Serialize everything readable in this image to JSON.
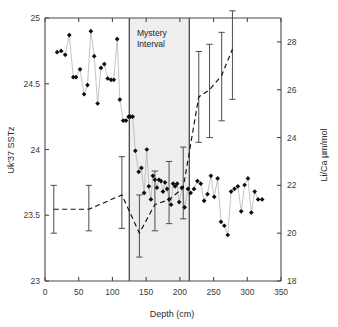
{
  "chart_data": {
    "type": "scatter",
    "title": "",
    "xlabel": "Depth (cm)",
    "ylabel": "Uk'37 SSTz",
    "y2label": "Li/Ca µm/mol",
    "xlim": [
      0,
      350
    ],
    "ylim": [
      23,
      25
    ],
    "y2lim": [
      18,
      29
    ],
    "xticks": [
      0,
      50,
      100,
      150,
      200,
      250,
      300,
      350
    ],
    "xticklabels": [
      "0",
      "50",
      "100",
      "150",
      "200",
      "250",
      "300",
      "350"
    ],
    "yticks": [
      23,
      23.5,
      24,
      24.5,
      25
    ],
    "yticklabels": [
      "23",
      "23.5",
      "24",
      "24.5",
      "25"
    ],
    "y2ticks": [
      18,
      20,
      22,
      24,
      26,
      28
    ],
    "y2ticklabels": [
      "18",
      "20",
      "22",
      "24",
      "26",
      "28"
    ],
    "grid": false,
    "legend": "none",
    "annotations": [
      {
        "name": "mystery-interval",
        "text": "Mystery\nInterval",
        "line1": "Mystery",
        "line2": "Interval",
        "x_start": 125,
        "x_end": 214,
        "shaded": true,
        "shade_color": "#e8e8e8"
      }
    ],
    "series": [
      {
        "name": "Uk'37 SSTz",
        "axis": "left",
        "marker": "filled-diamond",
        "marker_color": "#0c0c0c",
        "line_color": "#b9b9b9",
        "linestyle": "solid",
        "points": [
          [
            18,
            24.74
          ],
          [
            24,
            24.75
          ],
          [
            30,
            24.72
          ],
          [
            36,
            24.87
          ],
          [
            42,
            24.55
          ],
          [
            46,
            24.55
          ],
          [
            52,
            24.61
          ],
          [
            58,
            24.42
          ],
          [
            63,
            24.49
          ],
          [
            68,
            24.9
          ],
          [
            73,
            24.71
          ],
          [
            78,
            24.35
          ],
          [
            83,
            24.62
          ],
          [
            88,
            24.65
          ],
          [
            93,
            24.54
          ],
          [
            98,
            24.53
          ],
          [
            102,
            24.53
          ],
          [
            107,
            24.84
          ],
          [
            111,
            24.38
          ],
          [
            116,
            24.22
          ],
          [
            120,
            24.22
          ],
          [
            124,
            24.25
          ],
          [
            127,
            24.25
          ],
          [
            130,
            24.25
          ],
          [
            134,
            23.99
          ],
          [
            139,
            23.83
          ],
          [
            143,
            23.86
          ],
          [
            147,
            23.67
          ],
          [
            151,
            24.0
          ],
          [
            154,
            23.72
          ],
          [
            157,
            23.62
          ],
          [
            160,
            23.8
          ],
          [
            163,
            23.77
          ],
          [
            166,
            23.71
          ],
          [
            169,
            23.77
          ],
          [
            172,
            23.76
          ],
          [
            175,
            23.68
          ],
          [
            178,
            23.75
          ],
          [
            181,
            23.7
          ],
          [
            184,
            23.62
          ],
          [
            187,
            23.58
          ],
          [
            190,
            23.74
          ],
          [
            193,
            23.72
          ],
          [
            196,
            23.74
          ],
          [
            199,
            23.6
          ],
          [
            203,
            23.71
          ],
          [
            207,
            23.56
          ],
          [
            212,
            23.7
          ],
          [
            216,
            23.67
          ],
          [
            221,
            23.7
          ],
          [
            226,
            23.76
          ],
          [
            231,
            23.74
          ],
          [
            236,
            23.61
          ],
          [
            241,
            23.66
          ],
          [
            246,
            23.8
          ],
          [
            251,
            23.64
          ],
          [
            256,
            23.78
          ],
          [
            261,
            23.45
          ],
          [
            266,
            23.42
          ],
          [
            271,
            23.35
          ],
          [
            276,
            23.68
          ],
          [
            281,
            23.7
          ],
          [
            286,
            23.72
          ],
          [
            291,
            23.53
          ],
          [
            296,
            23.73
          ],
          [
            301,
            23.78
          ],
          [
            306,
            23.52
          ],
          [
            311,
            23.68
          ],
          [
            316,
            23.62
          ],
          [
            322,
            23.62
          ]
        ]
      },
      {
        "name": "Li/Ca",
        "axis": "right",
        "marker": "none",
        "line_color": "#111111",
        "linestyle": "dashed",
        "errorbar_color": "#555555",
        "points": [
          [
            13,
            21.0,
            20.0,
            22.0
          ],
          [
            65,
            21.0,
            20.1,
            22.0
          ],
          [
            114,
            21.6,
            20.2,
            23.2
          ],
          [
            140,
            20.0,
            19.0,
            21.6
          ],
          [
            163,
            21.2,
            20.1,
            22.6
          ],
          [
            184,
            21.4,
            20.4,
            23.0
          ],
          [
            205,
            21.9,
            20.6,
            23.6
          ],
          [
            228,
            25.7,
            23.8,
            27.6
          ],
          [
            244,
            26.0,
            24.0,
            27.9
          ],
          [
            262,
            26.6,
            24.7,
            28.4
          ],
          [
            278,
            27.7,
            25.6,
            29.3
          ]
        ]
      }
    ]
  },
  "figure": {
    "background": "#ffffff",
    "frame_color": "#4a4a4a"
  }
}
